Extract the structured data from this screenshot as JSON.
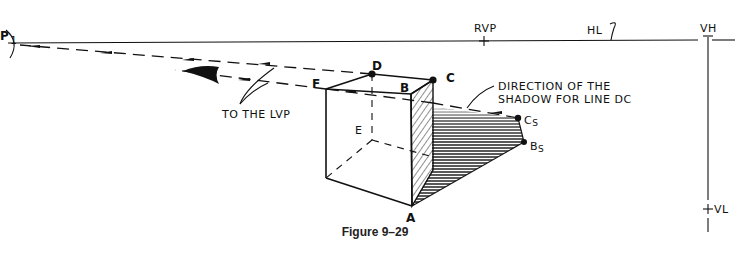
{
  "labels": {
    "p": "P",
    "p_sub": "1",
    "rvp": "RVP",
    "hl": "HL",
    "vh": "VH",
    "vl": "VL",
    "d": "D",
    "c": "C",
    "f": "F",
    "b": "B",
    "e": "E",
    "a": "A",
    "cs": "C",
    "cs_sub": "S",
    "bs": "B",
    "bs_sub": "S",
    "to_lvp": "TO THE LVP",
    "direction_line1": "DIRECTION OF THE",
    "direction_line2": "SHADOW FOR LINE DC"
  },
  "caption": "Figure 9–29",
  "colors": {
    "ink": "#111111",
    "background": "#ffffff"
  }
}
